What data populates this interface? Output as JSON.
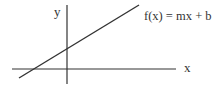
{
  "diagram": {
    "colors": {
      "background": "#ffffff",
      "stroke": "#333333",
      "text": "#333333"
    },
    "axes": {
      "x_label": "x",
      "y_label": "y"
    },
    "function_label": "f(x) = mx + b",
    "elements": [
      {
        "type": "axis",
        "name": "x-axis",
        "from": [
          12,
          69
        ],
        "to": [
          176,
          69
        ]
      },
      {
        "type": "axis",
        "name": "y-axis",
        "from": [
          67,
          5
        ],
        "to": [
          67,
          84
        ]
      },
      {
        "type": "line",
        "name": "function-line",
        "from": [
          19,
          78
        ],
        "to": [
          139,
          5
        ]
      }
    ]
  }
}
